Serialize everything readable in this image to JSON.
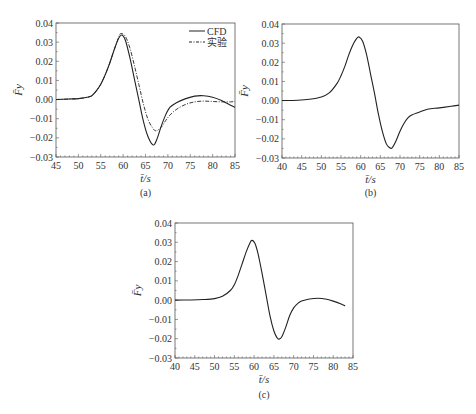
{
  "chart_data": [
    {
      "id": "a",
      "type": "line",
      "caption": "(a)",
      "xlabel": "t̄/s",
      "ylabel": "F̄y",
      "xlim": [
        45,
        85
      ],
      "ylim": [
        -0.03,
        0.04
      ],
      "xticks": [
        45,
        50,
        55,
        60,
        65,
        70,
        75,
        80,
        85
      ],
      "yticks": [
        "0.04",
        "0.03",
        "0.02",
        "0.01",
        "0.00",
        "-0.01",
        "-0.02",
        "-0.03"
      ],
      "grid": false,
      "legend_position": "upper right",
      "series": [
        {
          "name": "CFD",
          "style": "solid",
          "x": [
            45,
            48,
            50,
            52,
            53,
            54,
            55,
            56,
            57,
            58,
            59,
            59.7,
            60.5,
            61.5,
            62.5,
            63.5,
            64.5,
            65.5,
            66.7,
            67.5,
            68.5,
            69.5,
            70.5,
            72,
            74,
            76,
            78,
            80,
            82,
            84,
            85
          ],
          "y": [
            0.0,
            0.0003,
            0.0005,
            0.0012,
            0.002,
            0.0045,
            0.008,
            0.013,
            0.019,
            0.026,
            0.032,
            0.0337,
            0.031,
            0.022,
            0.011,
            0.0,
            -0.011,
            -0.019,
            -0.0237,
            -0.021,
            -0.014,
            -0.008,
            -0.004,
            -0.0015,
            0.0005,
            0.0018,
            0.002,
            0.0012,
            -0.0005,
            -0.003,
            -0.004
          ]
        },
        {
          "name": "实验",
          "style": "dash-dot",
          "x": [
            45,
            48,
            50,
            52,
            53,
            54,
            55,
            56,
            57,
            58,
            59,
            59.5,
            60.5,
            61.5,
            62.5,
            63.5,
            64.5,
            65.5,
            66.5,
            67.3,
            68.5,
            69.5,
            70.5,
            72,
            74,
            76,
            78,
            80,
            82,
            84,
            85
          ],
          "y": [
            0.0,
            0.0003,
            0.0005,
            0.0012,
            0.002,
            0.0045,
            0.008,
            0.013,
            0.019,
            0.026,
            0.0325,
            0.0345,
            0.033,
            0.027,
            0.018,
            0.008,
            -0.002,
            -0.01,
            -0.0145,
            -0.0163,
            -0.0145,
            -0.011,
            -0.008,
            -0.005,
            -0.0025,
            -0.0012,
            -0.0008,
            -0.001,
            -0.0012,
            -0.0012,
            -0.001
          ]
        }
      ]
    },
    {
      "id": "b",
      "type": "line",
      "caption": "(b)",
      "xlabel": "t̄/s",
      "ylabel": "F̄y",
      "xlim": [
        40,
        85
      ],
      "ylim": [
        -0.03,
        0.04
      ],
      "xticks": [
        40,
        45,
        50,
        55,
        60,
        65,
        70,
        75,
        80,
        85
      ],
      "yticks": [
        "0.04",
        "0.03",
        "0.02",
        "0.01",
        "0.00",
        "-0.01",
        "-0.02",
        "-0.03"
      ],
      "grid": false,
      "series": [
        {
          "name": "CFD",
          "style": "solid",
          "x": [
            40,
            44,
            47,
            50,
            52,
            54,
            55,
            56,
            57,
            58,
            59,
            59.6,
            60.5,
            61.5,
            62.5,
            63.5,
            64.5,
            65.5,
            66.5,
            67.3,
            68,
            69,
            70,
            71,
            72,
            73,
            75,
            77,
            80,
            83,
            85
          ],
          "y": [
            0.0,
            0.0002,
            0.0007,
            0.0019,
            0.004,
            0.009,
            0.013,
            0.018,
            0.024,
            0.029,
            0.0325,
            0.0332,
            0.031,
            0.024,
            0.014,
            0.004,
            -0.007,
            -0.016,
            -0.0225,
            -0.0245,
            -0.0247,
            -0.021,
            -0.016,
            -0.012,
            -0.009,
            -0.0075,
            -0.006,
            -0.0045,
            -0.0038,
            -0.003,
            -0.0024
          ]
        }
      ]
    },
    {
      "id": "c",
      "type": "line",
      "caption": "(c)",
      "xlabel": "t̄/s",
      "ylabel": "F̄y",
      "xlim": [
        40,
        85
      ],
      "ylim": [
        -0.03,
        0.04
      ],
      "xticks": [
        40,
        45,
        50,
        55,
        60,
        65,
        70,
        75,
        80,
        85
      ],
      "yticks": [
        "0.04",
        "0.03",
        "0.02",
        "0.01",
        "0.00",
        "-0.01",
        "-0.02",
        "-0.03"
      ],
      "grid": false,
      "series": [
        {
          "name": "CFD",
          "style": "solid",
          "x": [
            40,
            44,
            47,
            50,
            52,
            54,
            55,
            56,
            57,
            58,
            58.8,
            59.4,
            60.2,
            61,
            62,
            63,
            64,
            65,
            65.8,
            66.3,
            67,
            68,
            69,
            70,
            71,
            72,
            74,
            76.2,
            78,
            80,
            82,
            83
          ],
          "y": [
            0.0,
            0.0001,
            0.0003,
            0.0008,
            0.002,
            0.005,
            0.008,
            0.013,
            0.019,
            0.025,
            0.029,
            0.031,
            0.0295,
            0.024,
            0.014,
            0.003,
            -0.008,
            -0.016,
            -0.0195,
            -0.0202,
            -0.019,
            -0.014,
            -0.008,
            -0.004,
            -0.0018,
            -0.0005,
            0.0006,
            0.001,
            0.0006,
            -0.0005,
            -0.002,
            -0.003
          ]
        }
      ]
    }
  ],
  "panels": {
    "a": {
      "caption": "(a)",
      "xlabel": "t̄/s",
      "legend": [
        "CFD",
        "实验"
      ]
    },
    "b": {
      "caption": "(b)",
      "xlabel": "t̄/s"
    },
    "c": {
      "caption": "(c)",
      "xlabel": "t̄/s"
    }
  }
}
